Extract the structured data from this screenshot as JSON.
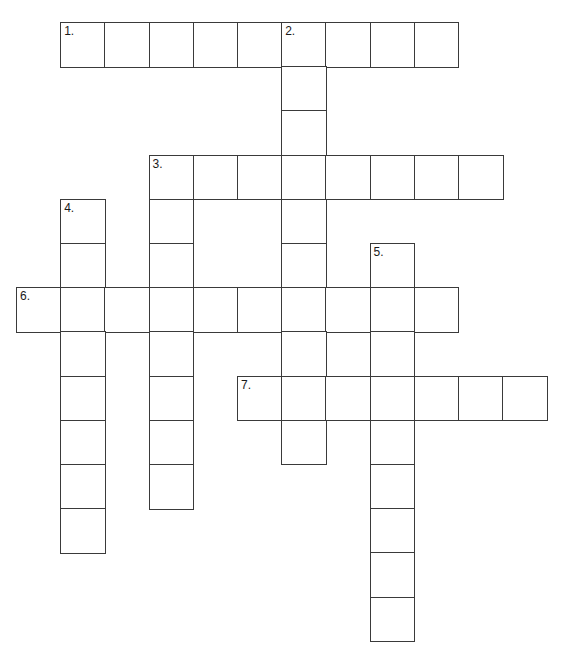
{
  "puzzle": {
    "type": "crossword-grid",
    "title": "",
    "cell_size": 44.2,
    "origin_x": 16,
    "origin_y": 22,
    "grid_columns": 12,
    "grid_rows": 14,
    "cell_border_color": "#3a3a3a",
    "cell_fill_color": "#ffffff",
    "background_color": "#ffffff",
    "entries": [
      {
        "number": "1.",
        "direction": "across",
        "row": 0,
        "col": 1,
        "length": 9,
        "answer": ""
      },
      {
        "number": "2.",
        "direction": "down",
        "row": 0,
        "col": 6,
        "length": 10,
        "answer": ""
      },
      {
        "number": "3.",
        "direction": "across",
        "row": 3,
        "col": 3,
        "length": 8,
        "answer": ""
      },
      {
        "number": "3.",
        "direction": "down",
        "row": 3,
        "col": 3,
        "length": 8,
        "answer": ""
      },
      {
        "number": "4.",
        "direction": "down",
        "row": 4,
        "col": 1,
        "length": 8,
        "answer": ""
      },
      {
        "number": "5.",
        "direction": "down",
        "row": 5,
        "col": 8,
        "length": 9,
        "answer": ""
      },
      {
        "number": "6.",
        "direction": "across",
        "row": 6,
        "col": 0,
        "length": 10,
        "answer": ""
      },
      {
        "number": "7.",
        "direction": "across",
        "row": 8,
        "col": 5,
        "length": 7,
        "answer": ""
      }
    ],
    "cells": [
      {
        "row": 0,
        "col": 1,
        "number": "1.",
        "letter": ""
      },
      {
        "row": 0,
        "col": 2,
        "number": "",
        "letter": ""
      },
      {
        "row": 0,
        "col": 3,
        "number": "",
        "letter": ""
      },
      {
        "row": 0,
        "col": 4,
        "number": "",
        "letter": ""
      },
      {
        "row": 0,
        "col": 5,
        "number": "",
        "letter": ""
      },
      {
        "row": 0,
        "col": 6,
        "number": "2.",
        "letter": ""
      },
      {
        "row": 0,
        "col": 7,
        "number": "",
        "letter": ""
      },
      {
        "row": 0,
        "col": 8,
        "number": "",
        "letter": ""
      },
      {
        "row": 0,
        "col": 9,
        "number": "",
        "letter": ""
      },
      {
        "row": 1,
        "col": 6,
        "number": "",
        "letter": ""
      },
      {
        "row": 2,
        "col": 6,
        "number": "",
        "letter": ""
      },
      {
        "row": 3,
        "col": 3,
        "number": "3.",
        "letter": ""
      },
      {
        "row": 3,
        "col": 4,
        "number": "",
        "letter": ""
      },
      {
        "row": 3,
        "col": 5,
        "number": "",
        "letter": ""
      },
      {
        "row": 3,
        "col": 6,
        "number": "",
        "letter": ""
      },
      {
        "row": 3,
        "col": 7,
        "number": "",
        "letter": ""
      },
      {
        "row": 3,
        "col": 8,
        "number": "",
        "letter": ""
      },
      {
        "row": 3,
        "col": 9,
        "number": "",
        "letter": ""
      },
      {
        "row": 3,
        "col": 10,
        "number": "",
        "letter": ""
      },
      {
        "row": 4,
        "col": 1,
        "number": "4.",
        "letter": ""
      },
      {
        "row": 4,
        "col": 3,
        "number": "",
        "letter": ""
      },
      {
        "row": 4,
        "col": 6,
        "number": "",
        "letter": ""
      },
      {
        "row": 5,
        "col": 1,
        "number": "",
        "letter": ""
      },
      {
        "row": 5,
        "col": 3,
        "number": "",
        "letter": ""
      },
      {
        "row": 5,
        "col": 6,
        "number": "",
        "letter": ""
      },
      {
        "row": 5,
        "col": 8,
        "number": "5.",
        "letter": ""
      },
      {
        "row": 6,
        "col": 0,
        "number": "6.",
        "letter": ""
      },
      {
        "row": 6,
        "col": 1,
        "number": "",
        "letter": ""
      },
      {
        "row": 6,
        "col": 2,
        "number": "",
        "letter": ""
      },
      {
        "row": 6,
        "col": 3,
        "number": "",
        "letter": ""
      },
      {
        "row": 6,
        "col": 4,
        "number": "",
        "letter": ""
      },
      {
        "row": 6,
        "col": 5,
        "number": "",
        "letter": ""
      },
      {
        "row": 6,
        "col": 6,
        "number": "",
        "letter": ""
      },
      {
        "row": 6,
        "col": 7,
        "number": "",
        "letter": ""
      },
      {
        "row": 6,
        "col": 8,
        "number": "",
        "letter": ""
      },
      {
        "row": 6,
        "col": 9,
        "number": "",
        "letter": ""
      },
      {
        "row": 7,
        "col": 1,
        "number": "",
        "letter": ""
      },
      {
        "row": 7,
        "col": 3,
        "number": "",
        "letter": ""
      },
      {
        "row": 7,
        "col": 6,
        "number": "",
        "letter": ""
      },
      {
        "row": 7,
        "col": 8,
        "number": "",
        "letter": ""
      },
      {
        "row": 8,
        "col": 1,
        "number": "",
        "letter": ""
      },
      {
        "row": 8,
        "col": 3,
        "number": "",
        "letter": ""
      },
      {
        "row": 8,
        "col": 5,
        "number": "7.",
        "letter": ""
      },
      {
        "row": 8,
        "col": 6,
        "number": "",
        "letter": ""
      },
      {
        "row": 8,
        "col": 7,
        "number": "",
        "letter": ""
      },
      {
        "row": 8,
        "col": 8,
        "number": "",
        "letter": ""
      },
      {
        "row": 8,
        "col": 9,
        "number": "",
        "letter": ""
      },
      {
        "row": 8,
        "col": 10,
        "number": "",
        "letter": ""
      },
      {
        "row": 8,
        "col": 11,
        "number": "",
        "letter": ""
      },
      {
        "row": 9,
        "col": 1,
        "number": "",
        "letter": ""
      },
      {
        "row": 9,
        "col": 3,
        "number": "",
        "letter": ""
      },
      {
        "row": 9,
        "col": 6,
        "number": "",
        "letter": ""
      },
      {
        "row": 9,
        "col": 8,
        "number": "",
        "letter": ""
      },
      {
        "row": 10,
        "col": 1,
        "number": "",
        "letter": ""
      },
      {
        "row": 10,
        "col": 3,
        "number": "",
        "letter": ""
      },
      {
        "row": 10,
        "col": 8,
        "number": "",
        "letter": ""
      },
      {
        "row": 11,
        "col": 1,
        "number": "",
        "letter": ""
      },
      {
        "row": 11,
        "col": 8,
        "number": "",
        "letter": ""
      },
      {
        "row": 12,
        "col": 8,
        "number": "",
        "letter": ""
      },
      {
        "row": 13,
        "col": 8,
        "number": "",
        "letter": ""
      }
    ]
  }
}
